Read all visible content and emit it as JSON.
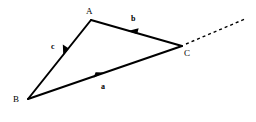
{
  "figure": {
    "kind": "vector-triangle-diagram",
    "background_color": "#ffffff",
    "stroke_color": "#000000",
    "stroke_width": 2,
    "width": 256,
    "height": 122,
    "vertices": [
      {
        "name": "A",
        "label": "A",
        "x": 91,
        "y": 20,
        "label_x": 86,
        "label_y": 7
      },
      {
        "name": "B",
        "label": "B",
        "x": 28,
        "y": 99,
        "label_x": 13,
        "label_y": 95
      },
      {
        "name": "C",
        "label": "C",
        "x": 182,
        "y": 46,
        "label_x": 184,
        "label_y": 49
      }
    ],
    "edges": [
      {
        "name": "side-a",
        "label": "a",
        "from": "B",
        "to": "C",
        "x1": 28,
        "y1": 99,
        "x2": 182,
        "y2": 46,
        "arrow_direction": "toward-C",
        "arrow_x": 100,
        "arrow_y": 74,
        "label_x": 101,
        "label_y": 83,
        "style": "solid"
      },
      {
        "name": "side-b",
        "label": "b",
        "from": "C",
        "to": "A",
        "x1": 182,
        "y1": 46,
        "x2": 91,
        "y2": 20,
        "arrow_direction": "toward-A",
        "arrow_x": 133,
        "arrow_y": 32,
        "label_x": 131,
        "label_y": 15,
        "style": "solid"
      },
      {
        "name": "side-c",
        "label": "c",
        "from": "A",
        "to": "B",
        "x1": 91,
        "y1": 20,
        "x2": 28,
        "y2": 99,
        "arrow_direction": "toward-B",
        "arrow_x": 65,
        "arrow_y": 52,
        "label_x": 51,
        "label_y": 43,
        "style": "solid"
      }
    ],
    "rays": [
      {
        "name": "extension-ray-from-C",
        "from": "C",
        "x1": 184,
        "y1": 45,
        "x2": 245,
        "y2": 19,
        "style": "dashed",
        "dash_pattern": "3 3"
      }
    ]
  }
}
